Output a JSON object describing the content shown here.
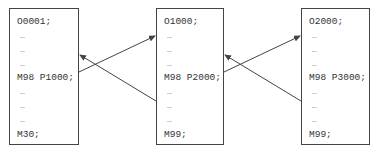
{
  "diagram": {
    "type": "subprogram-call-flow",
    "programs": [
      {
        "name": "O0001",
        "lines": [
          "O0001;",
          "…",
          "…",
          "…",
          "M98 P1000;",
          "…",
          "…",
          "…",
          "M30;"
        ]
      },
      {
        "name": "O1000",
        "lines": [
          "O1000;",
          "…",
          "…",
          "…",
          "M98 P2000;",
          "…",
          "…",
          "…",
          "M99;"
        ]
      },
      {
        "name": "O2000",
        "lines": [
          "O2000;",
          "…",
          "…",
          "…",
          "M98 P3000;",
          "…",
          "…",
          "…",
          "M99;"
        ]
      }
    ],
    "arrows": [
      {
        "from": "O0001 M98 P1000",
        "to": "O1000 start",
        "meaning": "call"
      },
      {
        "from": "O1000 end",
        "to": "O0001 after M98",
        "meaning": "return"
      },
      {
        "from": "O1000 M98 P2000",
        "to": "O2000 start",
        "meaning": "call"
      },
      {
        "from": "O2000 end",
        "to": "O1000 after M98",
        "meaning": "return"
      }
    ],
    "colors": {
      "line": "#444444",
      "text": "#333333",
      "background": "#ffffff"
    }
  }
}
